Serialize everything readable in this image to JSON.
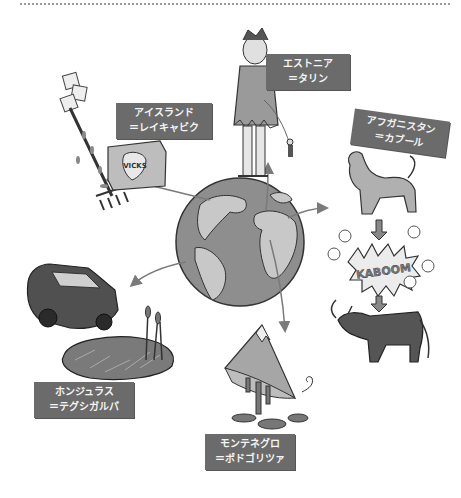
{
  "illustration": {
    "center": "globe",
    "labels": [
      {
        "id": "iceland",
        "country": "アイスランド",
        "capital": "＝レイキャビク"
      },
      {
        "id": "estonia",
        "country": "エストニア",
        "capital": "＝タリン"
      },
      {
        "id": "afghanistan",
        "country": "アフガニスタン",
        "capital": "＝カブール"
      },
      {
        "id": "honduras",
        "country": "ホンジュラス",
        "capital": "＝テグシガルパ"
      },
      {
        "id": "montenegro",
        "country": "モンテネグロ",
        "capital": "＝ポドゴリツァ"
      }
    ],
    "texts": {
      "vicks": "VICKS",
      "kaboom": "KABOOM"
    },
    "colors": {
      "label_bg": "#6b6b6b",
      "label_text": "#f4f4f4",
      "globe_ocean": "#8e8e8e",
      "globe_land": "#c8c8c8",
      "arrow": "#7a7a7a"
    }
  }
}
